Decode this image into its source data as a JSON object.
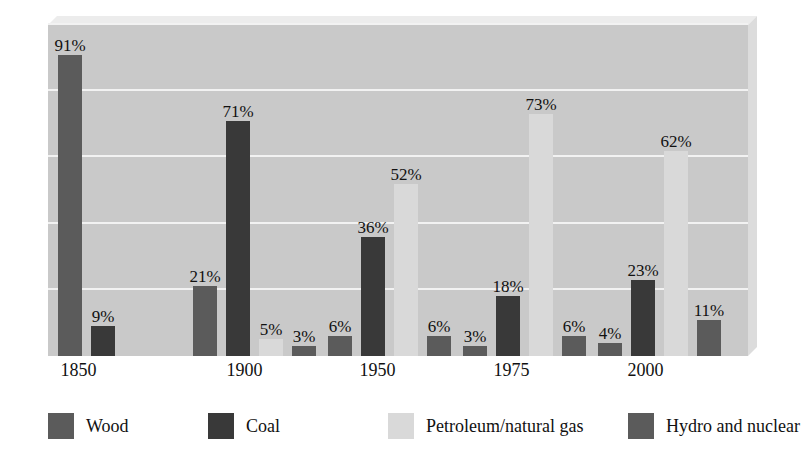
{
  "chart_data": {
    "type": "bar",
    "title": "",
    "subtitle": "",
    "xlabel": "",
    "ylabel": "",
    "ylim": [
      0,
      100
    ],
    "grid": true,
    "gridlines_percent": [
      20,
      40,
      60,
      80,
      100
    ],
    "legend_position": "bottom",
    "value_suffix": "%",
    "categories": [
      "1850",
      "1900",
      "1950",
      "1975",
      "2000"
    ],
    "series": [
      {
        "name": "Wood",
        "color": "#5b5b5b",
        "values": [
          91,
          21,
          6,
          3,
          4
        ]
      },
      {
        "name": "Coal",
        "color": "#393939",
        "values": [
          9,
          71,
          36,
          18,
          23
        ]
      },
      {
        "name": "Petroleum/natural gas",
        "color": "#d9d9d9",
        "values": [
          null,
          5,
          52,
          73,
          62
        ]
      },
      {
        "name": "Hydro and nuclear",
        "color": "#5b5b5b",
        "values": [
          null,
          3,
          6,
          6,
          11
        ]
      }
    ],
    "point_labels": [
      [
        "91%",
        "21%",
        "6%",
        "3%",
        "4%"
      ],
      [
        "9%",
        "71%",
        "36%",
        "18%",
        "23%"
      ],
      [
        "",
        "5%",
        "52%",
        "73%",
        "62%"
      ],
      [
        "",
        "3%",
        "6%",
        "6%",
        "11%"
      ]
    ]
  },
  "legend": {
    "items": [
      {
        "label": "Wood",
        "color": "#5b5b5b"
      },
      {
        "label": "Coal",
        "color": "#393939"
      },
      {
        "label": "Petroleum/natural gas",
        "color": "#d9d9d9"
      },
      {
        "label": "Hydro and nuclear",
        "color": "#5b5b5b"
      }
    ]
  },
  "axis": {
    "x_tick_labels": [
      "1850",
      "1900",
      "1950",
      "1975",
      "2000"
    ]
  },
  "colors": {
    "plot_background": "#c9c9c9",
    "gridline": "#f2f2f2",
    "page_background": "#ffffff",
    "text": "#111111",
    "bevel_top": "#ececec",
    "bevel_right": "#dcdcdc"
  }
}
